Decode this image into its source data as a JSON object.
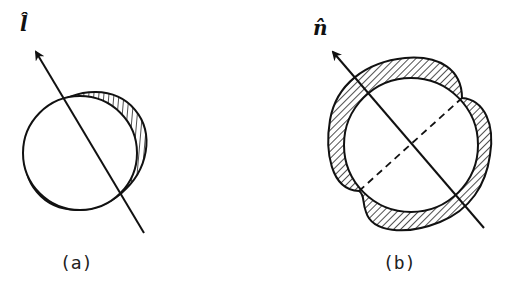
{
  "panels": [
    {
      "id": "a",
      "caption": "(a)",
      "axis_label": "l̂",
      "description": "Circle with displaced elliptical hatched region along direction l-hat"
    },
    {
      "id": "b",
      "caption": "(b)",
      "axis_label": "n̂",
      "description": "Circle with four-lobed hatched deformation; dashed perpendicular axis"
    }
  ],
  "colors": {
    "stroke": "#111111",
    "hatch": "#222222",
    "background": "#ffffff"
  }
}
